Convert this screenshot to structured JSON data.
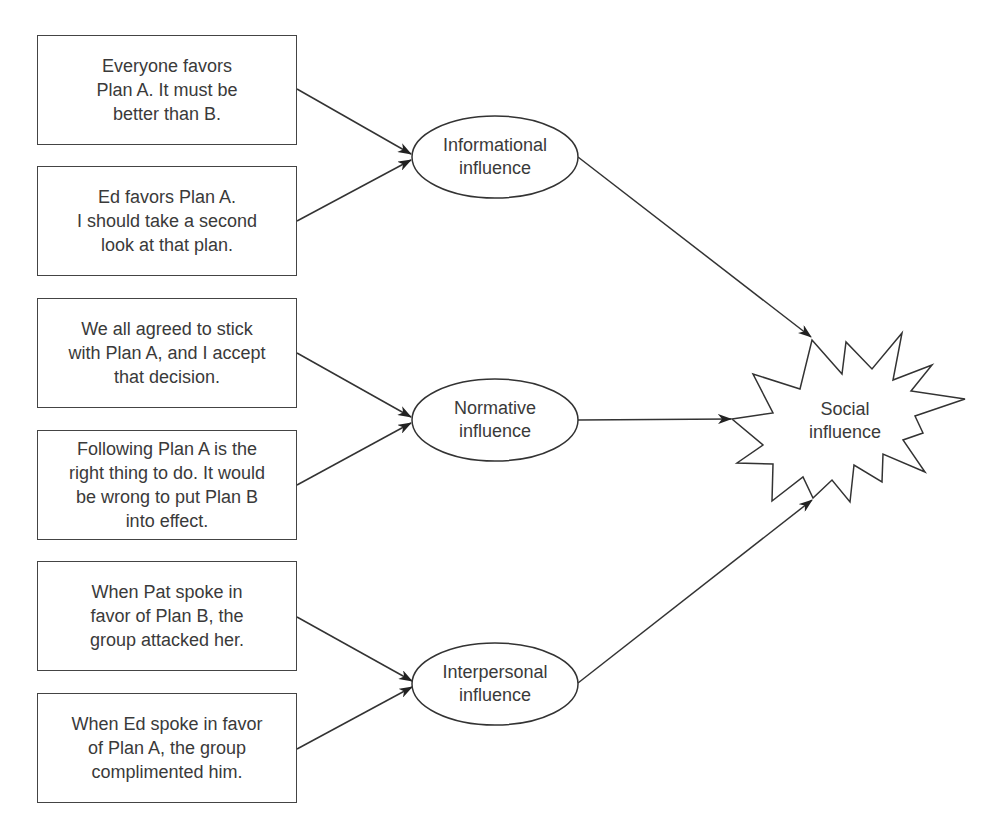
{
  "diagram": {
    "type": "flow",
    "sources": [
      {
        "id": "s1",
        "text": "Everyone favors\nPlan A. It must be\nbetter than B.",
        "target": "informational"
      },
      {
        "id": "s2",
        "text": "Ed favors Plan A.\nI should take a second\nlook at that plan.",
        "target": "informational"
      },
      {
        "id": "s3",
        "text": "We all agreed to stick\nwith Plan A, and I accept\nthat decision.",
        "target": "normative"
      },
      {
        "id": "s4",
        "text": "Following Plan A is the\nright thing to do. It would\nbe wrong to put Plan B\ninto effect.",
        "target": "normative"
      },
      {
        "id": "s5",
        "text": "When Pat spoke in\nfavor of Plan B, the\ngroup attacked her.",
        "target": "interpersonal"
      },
      {
        "id": "s6",
        "text": "When Ed spoke in favor\nof Plan A, the group\ncomplimented him.",
        "target": "interpersonal"
      }
    ],
    "intermediates": [
      {
        "id": "informational",
        "text": "Informational\ninfluence",
        "target": "social"
      },
      {
        "id": "normative",
        "text": "Normative\ninfluence",
        "target": "social"
      },
      {
        "id": "interpersonal",
        "text": "Interpersonal\ninfluence",
        "target": "social"
      }
    ],
    "outcome": {
      "id": "social",
      "text": "Social\ninfluence"
    }
  }
}
